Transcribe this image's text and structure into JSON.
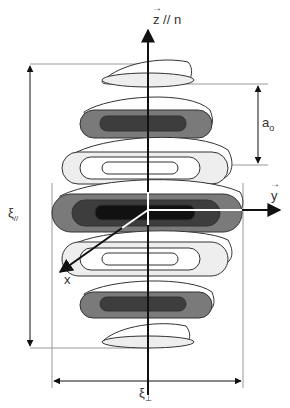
{
  "figure": {
    "type": "diagram",
    "axes": {
      "z_label": "z // n",
      "y_label": "y",
      "x_label": "x"
    },
    "dimensions": {
      "spacing_label": "a",
      "spacing_subscript": "o",
      "parallel_length_label": "ξ",
      "parallel_length_subscript": "//",
      "perp_length_label": "ξ",
      "perp_length_subscript": "⊥"
    },
    "colors": {
      "darkest": "#111111",
      "dark": "#3d3d3d",
      "medium": "#7a7a7a",
      "light": "#eeeeee",
      "outline": "#333333",
      "guide_line": "#999999"
    },
    "lobes": [
      {
        "cy": 78,
        "rx_left": 52,
        "rx_right": 46,
        "shade": "light"
      },
      {
        "cy": 123,
        "rx_left": 70,
        "rx_right": 64,
        "shade": "dark"
      },
      {
        "cy": 168,
        "rx_left": 85,
        "rx_right": 78,
        "shade": "light-rings"
      },
      {
        "cy": 213,
        "rx_left": 95,
        "rx_right": 95,
        "shade": "darkest"
      },
      {
        "cy": 258,
        "rx_left": 85,
        "rx_right": 78,
        "shade": "light-rings"
      },
      {
        "cy": 303,
        "rx_left": 70,
        "rx_right": 64,
        "shade": "dark"
      },
      {
        "cy": 340,
        "rx_left": 52,
        "rx_right": 46,
        "shade": "light"
      }
    ]
  }
}
